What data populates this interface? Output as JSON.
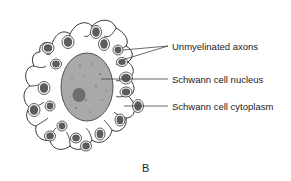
{
  "figure": {
    "panel_letter": "B",
    "labels": [
      {
        "id": "axons",
        "text": "Unmyelinated axons",
        "x": 172,
        "y": 42
      },
      {
        "id": "nucleus",
        "text": "Schwann cell nucleus",
        "x": 172,
        "y": 75
      },
      {
        "id": "cytoplasm",
        "text": "Schwann cell cytoplasm",
        "x": 172,
        "y": 103
      }
    ],
    "colors": {
      "nucleus_fill": "#a9a9a9",
      "nucleolus_fill": "#6e6e6e",
      "axon_fill": "#5c5c5c",
      "outline": "#333333",
      "background": "#ffffff"
    }
  }
}
